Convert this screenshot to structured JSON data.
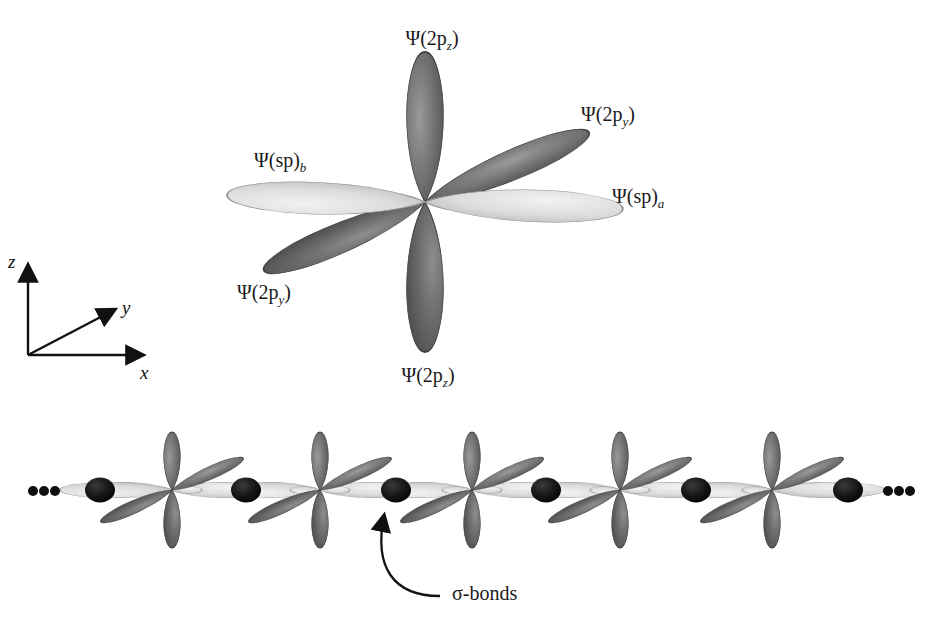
{
  "figure": {
    "background": "#ffffff",
    "ink": "#1a1a1a"
  },
  "colors": {
    "p_orbital_dark": "#5f5f5f",
    "p_orbital_dark_edge": "#3a3a3a",
    "sp_orbital_light": "#d6d6d6",
    "sp_orbital_light_edge": "#8a8a8a",
    "sigma_bond_fill": "#101010",
    "line": "#111111"
  },
  "axes": {
    "name": "coordinate-axes",
    "origin": {
      "x": 28,
      "y": 355
    },
    "labels": {
      "z": "z",
      "y": "y",
      "x": "x"
    },
    "z_tip": {
      "x": 28,
      "y": 258
    },
    "y_tip": {
      "x": 120,
      "y": 305
    },
    "x_tip": {
      "x": 150,
      "y": 355
    }
  },
  "top_diagram": {
    "name": "sp-hybrid-orbital-set",
    "center": {
      "x": 425,
      "y": 202
    },
    "orbitals": [
      {
        "id": "pz-up",
        "kind": "p",
        "label": "Ψ(2p",
        "sub": "z",
        "angle_deg": -90,
        "length": 150,
        "width": 62,
        "shade": "dark"
      },
      {
        "id": "pz-down",
        "kind": "p",
        "label": "Ψ(2p",
        "sub": "z",
        "angle_deg": 90,
        "length": 150,
        "width": 62,
        "shade": "dark"
      },
      {
        "id": "py-upright",
        "kind": "p",
        "label": "Ψ(2p",
        "sub": "y",
        "angle_deg": -23,
        "length": 175,
        "width": 52,
        "shade": "dark"
      },
      {
        "id": "py-downleft",
        "kind": "p",
        "label": "Ψ(2p",
        "sub": "y",
        "angle_deg": 157,
        "length": 175,
        "width": 52,
        "shade": "dark"
      },
      {
        "id": "sp-a",
        "kind": "sp",
        "label": "Ψ(sp)",
        "sub": "a",
        "angle_deg": 2,
        "length": 195,
        "width": 52,
        "shade": "light"
      },
      {
        "id": "sp-b",
        "kind": "sp",
        "label": "Ψ(sp)",
        "sub": "b",
        "angle_deg": 182,
        "length": 195,
        "width": 52,
        "shade": "light"
      }
    ],
    "labels": [
      {
        "id": "label-pz-top",
        "text_main": "Ψ(2p",
        "sub": "z",
        "tail": ")",
        "x": 432,
        "y": 28,
        "align": "center"
      },
      {
        "id": "label-py-right",
        "text_main": "Ψ(2p",
        "sub": "y",
        "tail": ")",
        "x": 581,
        "y": 104,
        "align": "left"
      },
      {
        "id": "label-sp-b",
        "text_main": "Ψ(sp)",
        "sub": "b",
        "tail": "",
        "x": 254,
        "y": 150,
        "align": "left"
      },
      {
        "id": "label-sp-a",
        "text_main": "Ψ(sp)",
        "sub": "a",
        "tail": "",
        "x": 612,
        "y": 186,
        "align": "left"
      },
      {
        "id": "label-py-left",
        "text_main": "Ψ(2p",
        "sub": "y",
        "tail": ")",
        "x": 237,
        "y": 282,
        "align": "left"
      },
      {
        "id": "label-pz-bottom",
        "text_main": "Ψ(2p",
        "sub": "z",
        "tail": ")",
        "x": 428,
        "y": 365,
        "align": "center"
      }
    ]
  },
  "chain_diagram": {
    "name": "linear-sp-chain",
    "baseline_y": 490,
    "atom_centers_x": [
      172,
      320,
      472,
      620,
      772
    ],
    "atom_count": 5,
    "sigma_bond_count": 6,
    "sigma_bond_centers_x": [
      100,
      246,
      396,
      546,
      696,
      848
    ],
    "ellipsis_left": {
      "text": "•••",
      "x": 33,
      "y": 491,
      "dots": 3
    },
    "ellipsis_right": {
      "text": "•••",
      "x": 888,
      "y": 491,
      "dots": 3
    },
    "callout": {
      "id": "sigma-bond-callout",
      "label": "σ-bonds",
      "label_x": 452,
      "label_y": 585,
      "arrow_tip": {
        "x": 388,
        "y": 507
      },
      "leader_end": {
        "x": 440,
        "y": 596
      }
    },
    "orbital_geometry": {
      "p_vertical_length": 58,
      "p_vertical_width": 28,
      "p_diagonal_length": 78,
      "p_diagonal_width": 24,
      "p_diagonal_angle_deg": -24,
      "sp_length": 84,
      "sp_width": 24
    }
  }
}
